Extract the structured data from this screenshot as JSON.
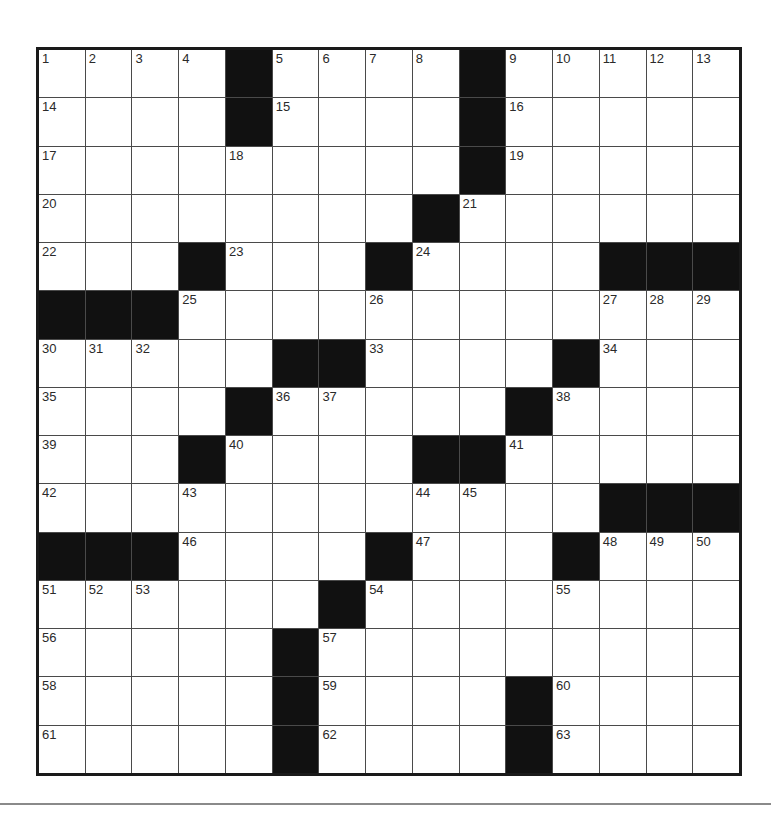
{
  "puzzle": {
    "rows": 15,
    "cols": 15,
    "colors": {
      "block": "#111111",
      "cell": "#ffffff",
      "border": "#1a1a1a",
      "gridline": "#4a4a4a",
      "rule": "#8a8a8a"
    },
    "grid": [
      [
        "1",
        "2",
        "3",
        "4",
        "#",
        "5",
        "6",
        "7",
        "8",
        "#",
        "9",
        "10",
        "11",
        "12",
        "13"
      ],
      [
        "14",
        "",
        "",
        "",
        "#",
        "15",
        "",
        "",
        "",
        "#",
        "16",
        "",
        "",
        "",
        ""
      ],
      [
        "17",
        "",
        "",
        "",
        "18",
        "",
        "",
        "",
        "",
        "#",
        "19",
        "",
        "",
        "",
        ""
      ],
      [
        "20",
        "",
        "",
        "",
        "",
        "",
        "",
        "",
        "#",
        "21",
        "",
        "",
        "",
        "",
        ""
      ],
      [
        "22",
        "",
        "",
        "#",
        "23",
        "",
        "",
        "#",
        "24",
        "",
        "",
        "",
        "#",
        "#",
        "#"
      ],
      [
        "#",
        "#",
        "#",
        "25",
        "",
        "",
        "",
        "26",
        "",
        "",
        "",
        "",
        "27",
        "28",
        "29"
      ],
      [
        "30",
        "31",
        "32",
        "",
        "",
        "#",
        "#",
        "33",
        "",
        "",
        "",
        "#",
        "34",
        "",
        ""
      ],
      [
        "35",
        "",
        "",
        "",
        "#",
        "36",
        "37",
        "",
        "",
        "",
        "#",
        "38",
        "",
        "",
        ""
      ],
      [
        "39",
        "",
        "",
        "#",
        "40",
        "",
        "",
        "",
        "#",
        "#",
        "41",
        "",
        "",
        "",
        ""
      ],
      [
        "42",
        "",
        "",
        "43",
        "",
        "",
        "",
        "",
        "44",
        "45",
        "",
        "",
        "#",
        "#",
        "#"
      ],
      [
        "#",
        "#",
        "#",
        "46",
        "",
        "",
        "",
        "#",
        "47",
        "",
        "",
        "#",
        "48",
        "49",
        "50"
      ],
      [
        "51",
        "52",
        "53",
        "",
        "",
        "",
        "#",
        "54",
        "",
        "",
        "",
        "55",
        "",
        "",
        ""
      ],
      [
        "56",
        "",
        "",
        "",
        "",
        "#",
        "57",
        "",
        "",
        "",
        "",
        "",
        "",
        "",
        ""
      ],
      [
        "58",
        "",
        "",
        "",
        "",
        "#",
        "59",
        "",
        "",
        "",
        "#",
        "60",
        "",
        "",
        ""
      ],
      [
        "61",
        "",
        "",
        "",
        "",
        "#",
        "62",
        "",
        "",
        "",
        "#",
        "63",
        "",
        "",
        ""
      ]
    ]
  }
}
